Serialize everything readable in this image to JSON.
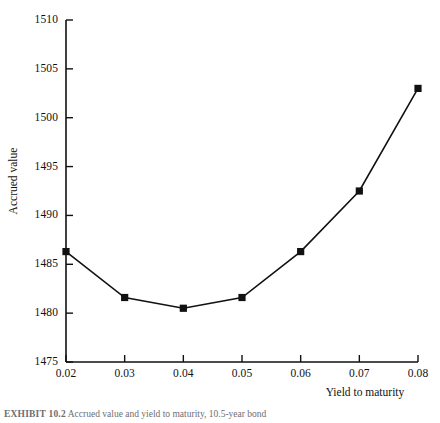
{
  "figure": {
    "background_color": "#ffffff",
    "ink_color": "#111111",
    "caption_label": "EXHIBIT 10.2",
    "caption_text": "Accrued value and yield to maturity, 10.5-year bond"
  },
  "chart_data": {
    "type": "line",
    "title": "",
    "xlabel": "Yield to maturity",
    "ylabel": "Accrued value",
    "x": [
      0.02,
      0.03,
      0.04,
      0.05,
      0.06,
      0.07,
      0.08
    ],
    "values": [
      1486.3,
      1481.6,
      1480.5,
      1481.6,
      1486.3,
      1492.5,
      1503.0
    ],
    "series": [
      {
        "name": "Accrued value",
        "values": [
          1486.3,
          1481.6,
          1480.5,
          1481.6,
          1486.3,
          1492.5,
          1503.0
        ]
      }
    ],
    "xlim": [
      0.02,
      0.08
    ],
    "ylim": [
      1475,
      1510
    ],
    "xticks": [
      0.02,
      0.03,
      0.04,
      0.05,
      0.06,
      0.07,
      0.08
    ],
    "xtick_labels": [
      "0.02",
      "0.03",
      "0.04",
      "0.05",
      "0.06",
      "0.07",
      "0.08"
    ],
    "yticks": [
      1475,
      1480,
      1485,
      1490,
      1495,
      1500,
      1505,
      1510
    ],
    "ytick_labels": [
      "1475",
      "1480",
      "1485",
      "1490",
      "1495",
      "1500",
      "1505",
      "1510"
    ],
    "grid": false,
    "legend": false,
    "legend_position": "none",
    "marker": "square",
    "marker_color": "#111111",
    "line_color": "#111111",
    "line_width": 1.6
  }
}
